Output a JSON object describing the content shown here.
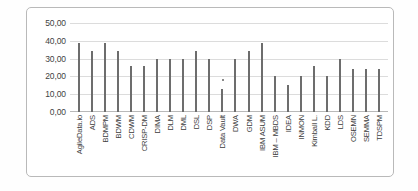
{
  "chart_data": {
    "type": "bar",
    "title": "",
    "xlabel": "",
    "ylabel": "",
    "ylim": [
      0,
      50
    ],
    "grid": true,
    "legend": "none",
    "decimal_separator": ",",
    "ytick_labels": [
      "50,00",
      "40,00",
      "30,00",
      "20,00",
      "10,00",
      "0,00"
    ],
    "ytick_values": [
      50,
      40,
      30,
      20,
      10,
      0
    ],
    "categories": [
      "AgileData.io",
      "ADS",
      "BDMPM",
      "BDWM",
      "CDWM",
      "CRISP-DM",
      "DIMA",
      "DLM",
      "DML",
      "DSL",
      "DSP",
      "Data Vault",
      "DWA",
      "GDM",
      "IBM ASUM",
      "IBM – MBDS",
      "IDEA",
      "INMON",
      "Kimball L.",
      "KDD",
      "LDS",
      "OSEMN",
      "SEMMA",
      "TDSPM"
    ],
    "values": [
      39.0,
      34.0,
      39.0,
      34.0,
      26.0,
      26.0,
      30.0,
      30.0,
      30.0,
      34.0,
      30.0,
      13.0,
      30.0,
      34.0,
      39.0,
      20.0,
      15.0,
      20.0,
      26.0,
      20.0,
      30.0,
      24.0,
      24.0,
      24.0
    ]
  }
}
